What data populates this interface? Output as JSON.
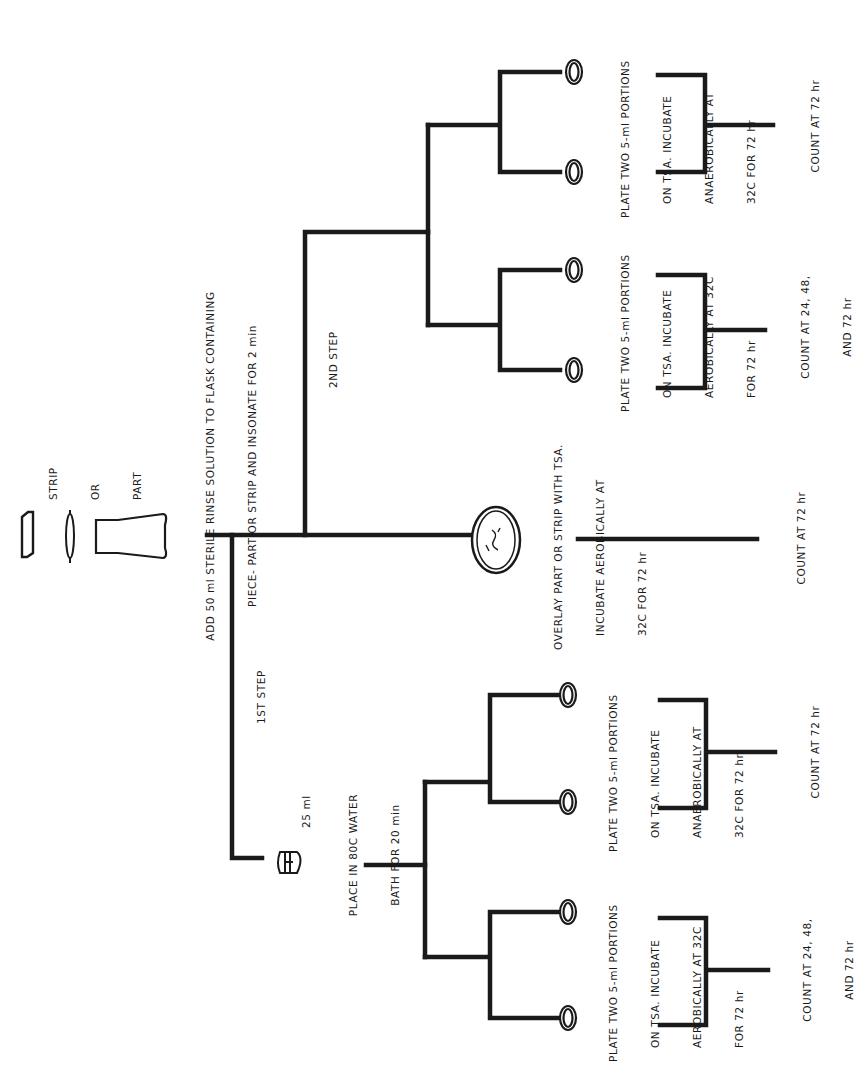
{
  "orientation": "rotated -90deg (text reads bottom-to-top)",
  "colors": {
    "ink": "#1a1a1a",
    "background": "#ffffff"
  },
  "root": {
    "legend": {
      "lines": [
        "STRIP",
        "OR",
        "PART"
      ],
      "icons": [
        "strip-icon",
        "part-icon",
        "flask-icon"
      ]
    },
    "instruction": {
      "line1": "ADD 50 ml STERILE RINSE SOLUTION TO FLASK CONTAINING",
      "line2": "PIECE- PART OR STRIP AND INSONATE FOR 2 min"
    }
  },
  "branches": {
    "first_step": {
      "label": "1ST STEP",
      "tube_volume": "25 ml",
      "instruction": {
        "line1": "PLACE IN 80C WATER",
        "line2": "BATH FOR 20 min"
      },
      "aerobic": {
        "lines": [
          "PLATE TWO 5-ml PORTIONS",
          "ON TSA. INCUBATE",
          "AEROBICALLY AT 32C",
          "FOR 72 hr"
        ],
        "count": [
          "COUNT AT 24, 48,",
          "AND 72 hr"
        ]
      },
      "anaerobic": {
        "lines": [
          "PLATE TWO 5-ml PORTIONS",
          "ON TSA. INCUBATE",
          "ANAEROBICALLY AT",
          "32C FOR 72 hr"
        ],
        "count": [
          "COUNT AT 72 hr"
        ]
      }
    },
    "overlay": {
      "lines": [
        "OVERLAY PART OR STRIP WITH TSA.",
        "INCUBATE AEROBICALLY AT",
        "32C FOR 72 hr"
      ],
      "count": [
        "COUNT AT 72 hr"
      ]
    },
    "second_step": {
      "label": "2ND STEP",
      "aerobic": {
        "lines": [
          "PLATE TWO 5-ml PORTIONS",
          "ON TSA. INCUBATE",
          "AEROBICALLY AT 32C",
          "FOR 72 hr"
        ],
        "count": [
          "COUNT AT 24, 48,",
          "AND 72 hr"
        ]
      },
      "anaerobic": {
        "lines": [
          "PLATE TWO 5-ml PORTIONS",
          "ON TSA. INCUBATE",
          "ANAEROBICALLY AT",
          "32C FOR 72 hr"
        ],
        "count": [
          "COUNT AT 72 hr"
        ]
      }
    }
  }
}
